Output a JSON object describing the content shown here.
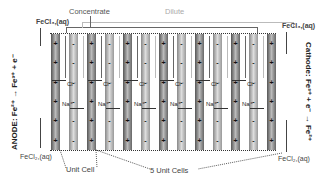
{
  "diagram": {
    "top_labels": {
      "concentrate": "Concentrate",
      "dilute": "Dilute"
    },
    "anode_label": "ANODE: Fe²⁺ → Fe³⁺ + e⁻",
    "cathode_label": "Cathode: Fe³⁺ + e⁻ → Fe²⁺",
    "inlets": {
      "left_top": "FeCl₃,(aq)",
      "right_top": "FeCl₃,(aq)",
      "left_bottom": "FeCl₂,(aq)",
      "right_bottom": "FeCl₂,(aq)"
    },
    "bottom_labels": {
      "unit_cell": "Unit Cell",
      "five_unit_cells": "5 Unit Cells"
    },
    "ions": {
      "chloride": "Cl⁻",
      "sodium": "Na⁺"
    },
    "membranes": [
      "+",
      "-",
      "+",
      "-",
      "+",
      "-",
      "+",
      "-",
      "+",
      "-",
      "+",
      "-",
      "+"
    ],
    "membrane_sign_plus": "+",
    "membrane_sign_minus": "-"
  }
}
